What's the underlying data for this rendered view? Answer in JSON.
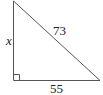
{
  "diagram": {
    "type": "right-triangle",
    "labels": {
      "vertical_leg": "x",
      "hypotenuse": "73",
      "horizontal_leg": "55"
    },
    "right_angle_marker": true,
    "stroke_color": "#444444"
  }
}
